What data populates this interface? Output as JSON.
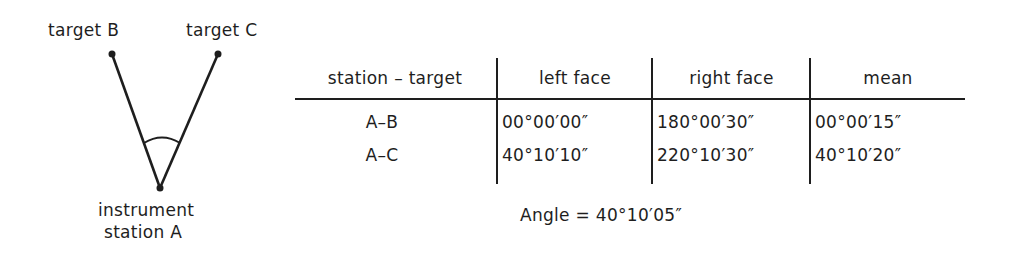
{
  "diagram": {
    "labels": {
      "target_b": "target B",
      "target_c": "target C",
      "station_line1": "instrument",
      "station_line2": "station A"
    },
    "points": {
      "B": [
        112,
        54
      ],
      "C": [
        218,
        54
      ],
      "A": [
        160,
        188
      ]
    }
  },
  "table": {
    "headers": [
      "station – target",
      "left face",
      "right face",
      "mean"
    ],
    "rows": [
      [
        "A–B",
        "00°00′00″",
        "180°00′30″",
        "00°00′15″"
      ],
      [
        "A–C",
        "40°10′10″",
        "220°10′30″",
        "40°10′20″"
      ]
    ]
  },
  "result": {
    "text": "Angle = 40°10′05″"
  }
}
